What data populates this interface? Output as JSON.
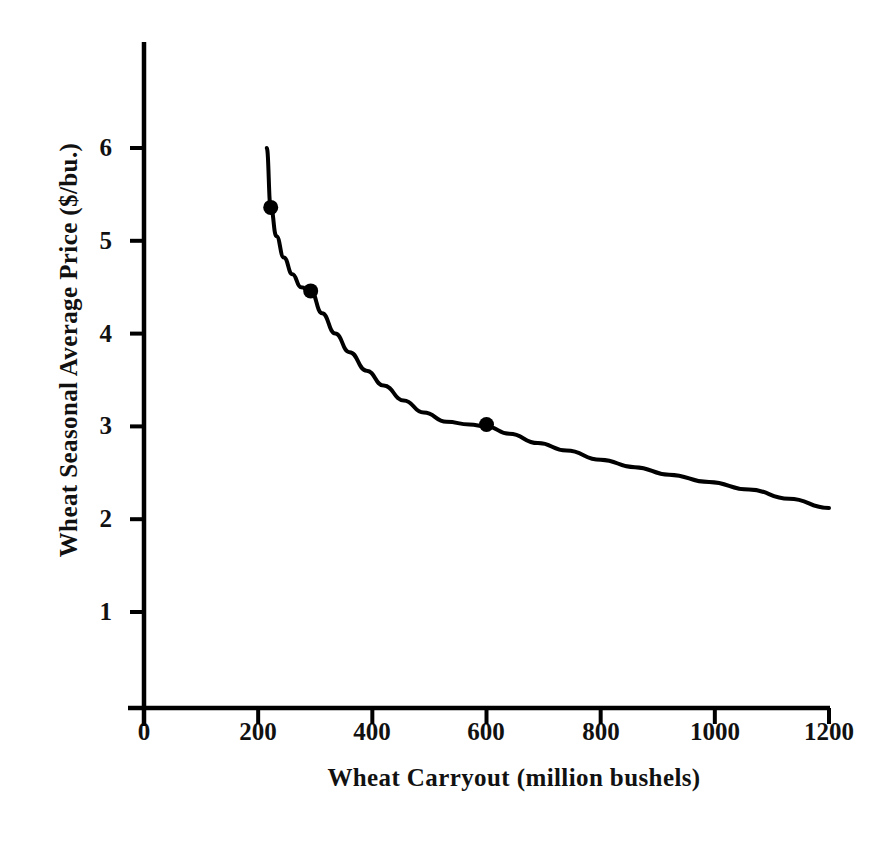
{
  "chart_data": {
    "type": "line",
    "title": "",
    "xlabel": "Wheat Carryout (million bushels)",
    "ylabel": "Wheat Seasonal Average Price ($/bu.)",
    "xlim": [
      0,
      1200
    ],
    "ylim": [
      0,
      6.6
    ],
    "grid": false,
    "legend": "none",
    "x_ticks": [
      0,
      200,
      400,
      600,
      800,
      1000,
      1200
    ],
    "x_tick_labels": [
      "0",
      "200",
      "400",
      "600",
      "800",
      "1000",
      "1200"
    ],
    "y_ticks": [
      1,
      2,
      3,
      4,
      5,
      6
    ],
    "y_tick_labels": [
      "1",
      "2",
      "3",
      "4",
      "5",
      "6"
    ],
    "series": [
      {
        "name": "Wheat price-carryout demand curve",
        "style": "solid-black-curve",
        "color": "#000000",
        "x": [
          215,
          222,
          232,
          245,
          260,
          275,
          292,
          312,
          335,
          360,
          390,
          420,
          455,
          490,
          530,
          570,
          600,
          640,
          690,
          740,
          800,
          860,
          920,
          990,
          1060,
          1130,
          1200
        ],
        "y": [
          6.0,
          5.36,
          5.05,
          4.82,
          4.64,
          4.5,
          4.46,
          4.22,
          4.0,
          3.8,
          3.6,
          3.44,
          3.28,
          3.15,
          3.05,
          3.02,
          3.0,
          2.92,
          2.82,
          2.74,
          2.64,
          2.56,
          2.48,
          2.4,
          2.32,
          2.22,
          2.12
        ]
      }
    ],
    "markers": [
      {
        "label": "point-1",
        "x": 222,
        "y": 5.36
      },
      {
        "label": "point-2",
        "x": 292,
        "y": 4.46
      },
      {
        "label": "point-3",
        "x": 600,
        "y": 3.02
      }
    ],
    "marker_style": "filled-circle",
    "marker_color": "#000000",
    "axis_color": "#000000",
    "background_color": "#ffffff"
  }
}
